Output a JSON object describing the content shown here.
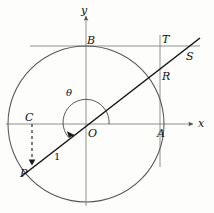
{
  "diagram": {
    "axes": {
      "x_label": "x",
      "y_label": "y",
      "origin_label": "O",
      "color": "#777777"
    },
    "curve_color": "#4a4a4a",
    "line_color": "#1a1a1a",
    "points": [
      {
        "name": "A",
        "label": "A",
        "x": 160,
        "y": 124,
        "label_x": 158,
        "label_y": 127
      },
      {
        "name": "B",
        "label": "B",
        "x": 86,
        "y": 46,
        "label_x": 87,
        "label_y": 36
      },
      {
        "name": "C",
        "label": "C",
        "x": 32,
        "y": 124,
        "label_x": 25,
        "label_y": 113
      },
      {
        "name": "P",
        "label": "P",
        "x": 32,
        "y": 164,
        "label_x": 21,
        "label_y": 167
      },
      {
        "name": "R",
        "label": "R",
        "x": 160,
        "y": 82,
        "label_x": 161,
        "label_y": 70
      },
      {
        "name": "S",
        "label": "S",
        "x": 181,
        "y": 50,
        "label_x": 186,
        "label_y": 52
      },
      {
        "name": "T",
        "label": "T",
        "x": 160,
        "y": 46,
        "label_x": 161,
        "label_y": 35
      },
      {
        "name": "O",
        "label": "O",
        "x": 86,
        "y": 124,
        "label_x": 89,
        "label_y": 127
      }
    ],
    "angle": {
      "label": "θ",
      "label_x": 68,
      "label_y": 92,
      "radius": 23
    },
    "radius_label": {
      "text": "1",
      "label_x": 54,
      "label_y": 155
    },
    "circle": {
      "cx": 86,
      "cy": 124,
      "r": 78
    },
    "tangent_vertical": {
      "x": 160,
      "y_top": 35,
      "y_bottom": 167
    },
    "tangent_horizontal": {
      "y": 46,
      "x_left": 30,
      "x_right": 200
    },
    "secant_line": {
      "x1": 22,
      "y1": 176,
      "x2": 200,
      "y2": 38
    },
    "dashed_segment": {
      "x": 32,
      "y_top": 124,
      "y_bottom": 164
    }
  }
}
